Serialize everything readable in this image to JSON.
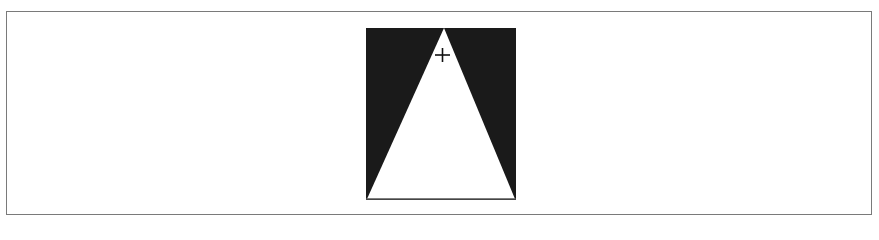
{
  "figure": {
    "colors": {
      "background": "#ffffff",
      "fill": "#1a1a1a",
      "triangle": "#ffffff",
      "frame_border": "#7a7a7a"
    },
    "icons": {
      "cursor": "crosshair-icon"
    }
  }
}
